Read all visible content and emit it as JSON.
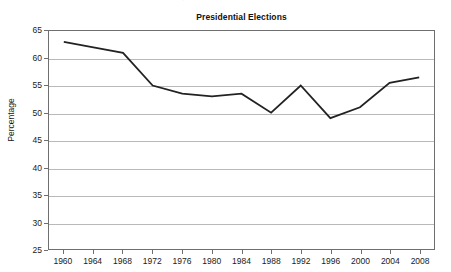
{
  "clipped_header": {
    "text": "Voter Turnout in Presidential Elections, 1960-2008"
  },
  "chart_data": {
    "type": "line",
    "title": "Presidential Elections",
    "xlabel": "",
    "ylabel": "Percentage",
    "categories": [
      "1960",
      "1964",
      "1968",
      "1972",
      "1976",
      "1980",
      "1984",
      "1988",
      "1992",
      "1996",
      "2000",
      "2004",
      "2008"
    ],
    "values": [
      63,
      62,
      61,
      55,
      53.5,
      53,
      53.5,
      50,
      55,
      49,
      51,
      55.5,
      56.5
    ],
    "ylim": [
      25,
      65
    ],
    "ytick_step": 5,
    "ytick_labels": [
      "65",
      "60",
      "55",
      "50",
      "45",
      "40",
      "35",
      "30",
      "25"
    ],
    "grid": "horizontal",
    "legend": "none",
    "series_color": "#222222",
    "gridline_color": "#b9b9b9",
    "frame_color": "#6f6f6f"
  }
}
